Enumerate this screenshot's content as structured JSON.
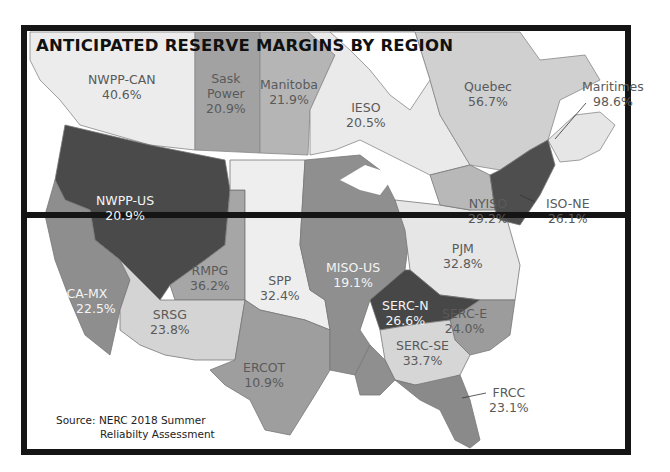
{
  "title": "ANTICIPATED RESERVE MARGINS BY REGION",
  "source": {
    "line1": "Source: NERC 2018 Summer",
    "line2": "Reliabilty Assessment"
  },
  "regions": {
    "nwpp_can": {
      "name": "NWPP-CAN",
      "value": "40.6%"
    },
    "sask": {
      "name_line1": "Sask",
      "name_line2": "Power",
      "value": "20.9%"
    },
    "manitoba": {
      "name": "Manitoba",
      "value": "21.9%"
    },
    "ieso": {
      "name": "IESO",
      "value": "20.5%"
    },
    "quebec": {
      "name": "Quebec",
      "value": "56.7%"
    },
    "maritimes": {
      "name": "Maritimes",
      "value": "98.6%"
    },
    "nwpp_us": {
      "name": "NWPP-US",
      "value": "20.9%"
    },
    "nyiso": {
      "name": "NYISO",
      "value": "29.2%"
    },
    "iso_ne": {
      "name": "ISO-NE",
      "value": "26.1%"
    },
    "pjm": {
      "name": "PJM",
      "value": "32.8%"
    },
    "rmpg": {
      "name": "RMPG",
      "value": "36.2%"
    },
    "spp": {
      "name": "SPP",
      "value": "32.4%"
    },
    "miso_us": {
      "name": "MISO-US",
      "value": "19.1%"
    },
    "ca_mx": {
      "name": "CA-MX",
      "value": "22.5%"
    },
    "srsg": {
      "name": "SRSG",
      "value": "23.8%"
    },
    "serc_n": {
      "name": "SERC-N",
      "value": "26.6%"
    },
    "serc_e": {
      "name": "SERC-E",
      "value": "24.0%"
    },
    "serc_se": {
      "name": "SERC-SE",
      "value": "33.7%"
    },
    "ercot": {
      "name": "ERCOT",
      "value": "10.9%"
    },
    "frcc": {
      "name": "FRCC",
      "value": "23.1%"
    }
  },
  "colors": {
    "frame": "#151515",
    "darkest": "#4a4a4a",
    "medium": "#8e8e8e",
    "mid_light": "#a9a9a9",
    "light": "#d2d2d2",
    "lightest": "#ececec",
    "water": "#ffffff"
  }
}
